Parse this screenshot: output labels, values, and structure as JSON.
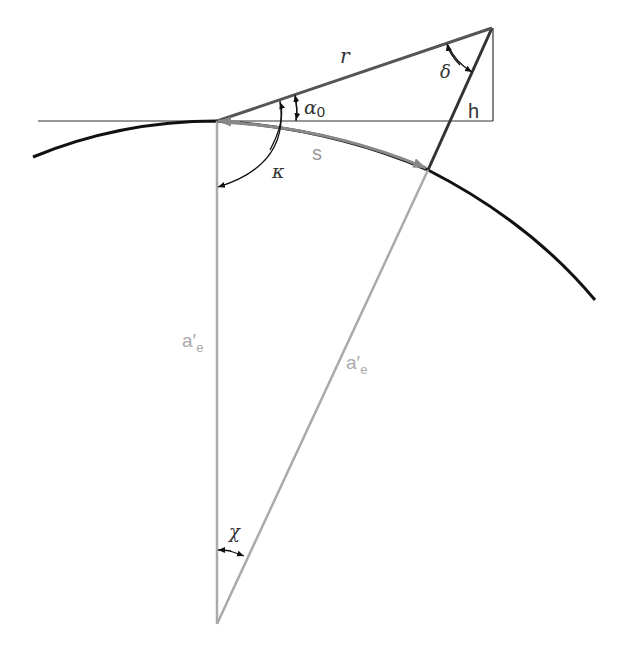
{
  "colors": {
    "dark": "#111111",
    "mid": "#666666",
    "light": "#aaaaaa",
    "thin": "#333333"
  },
  "labels": {
    "r": "r",
    "delta": "δ",
    "h": "h",
    "alpha0_main": "α",
    "alpha0_sub": "0",
    "s": "s",
    "kappa": "κ",
    "ae_left_main": "a′",
    "ae_left_sub": "e",
    "ae_right_main": "a′",
    "ae_right_sub": "e",
    "chi": "χ"
  }
}
